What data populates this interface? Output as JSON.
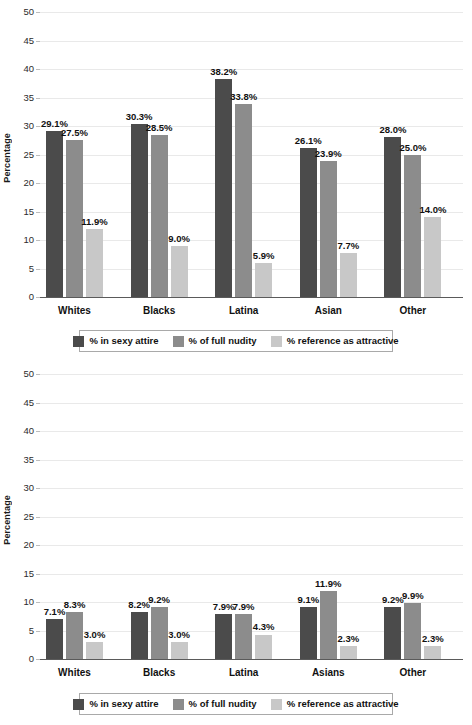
{
  "figure": {
    "background": "#ffffff",
    "series_colors": [
      "#4b4b4b",
      "#8c8c8c",
      "#c8c8c8"
    ]
  },
  "legend": {
    "items": [
      {
        "label": "% in sexy attire",
        "color": "#4b4b4b"
      },
      {
        "label": "% of full nudity",
        "color": "#8c8c8c"
      },
      {
        "label": "% reference as attractive",
        "color": "#c8c8c8"
      }
    ]
  },
  "chart_data": [
    {
      "id": "top",
      "type": "bar",
      "title": "",
      "xlabel": "",
      "ylabel": "Percentage",
      "ylim": [
        0,
        50
      ],
      "yticks": [
        0,
        5,
        10,
        15,
        20,
        25,
        30,
        35,
        40,
        45,
        50
      ],
      "ytick_labels": [
        "0",
        "5",
        "10",
        "15",
        "20",
        "25",
        "30",
        "35",
        "40",
        "45",
        "50"
      ],
      "grid": true,
      "legend_position": "below",
      "categories": [
        "Whites",
        "Blacks",
        "Latina",
        "Asian",
        "Other"
      ],
      "series": [
        {
          "name": "% in sexy attire",
          "color": "#4b4b4b",
          "values": [
            29.1,
            30.3,
            38.2,
            26.1,
            28.0
          ],
          "labels": [
            "29.1%",
            "30.3%",
            "38.2%",
            "26.1%",
            "28.0%"
          ]
        },
        {
          "name": "% of full nudity",
          "color": "#8c8c8c",
          "values": [
            27.5,
            28.5,
            33.8,
            23.9,
            25.0
          ],
          "labels": [
            "27.5%",
            "28.5%",
            "33.8%",
            "23.9%",
            "25.0%"
          ]
        },
        {
          "name": "% reference as attractive",
          "color": "#c8c8c8",
          "values": [
            11.9,
            9.0,
            5.9,
            7.7,
            14.0
          ],
          "labels": [
            "11.9%",
            "9.0%",
            "5.9%",
            "7.7%",
            "14.0%"
          ]
        }
      ]
    },
    {
      "id": "bottom",
      "type": "bar",
      "title": "",
      "xlabel": "",
      "ylabel": "Percentage",
      "ylim": [
        0,
        50
      ],
      "yticks": [
        0,
        5,
        10,
        15,
        20,
        25,
        30,
        35,
        40,
        45,
        50
      ],
      "ytick_labels": [
        "0",
        "5",
        "10",
        "15",
        "20",
        "25",
        "30",
        "35",
        "40",
        "45",
        "50"
      ],
      "grid": true,
      "legend_position": "below",
      "categories": [
        "Whites",
        "Blacks",
        "Latina",
        "Asians",
        "Other"
      ],
      "series": [
        {
          "name": "% in sexy attire",
          "color": "#4b4b4b",
          "values": [
            7.1,
            8.2,
            7.9,
            9.1,
            9.2
          ],
          "labels": [
            "7.1%",
            "8.2%",
            "7.9%",
            "9.1%",
            "9.2%"
          ]
        },
        {
          "name": "% of full nudity",
          "color": "#8c8c8c",
          "values": [
            8.3,
            9.2,
            7.9,
            11.9,
            9.9
          ],
          "labels": [
            "8.3%",
            "9.2%",
            "7.9%",
            "11.9%",
            "9.9%"
          ]
        },
        {
          "name": "% reference as attractive",
          "color": "#c8c8c8",
          "values": [
            3.0,
            3.0,
            4.3,
            2.3,
            2.3
          ],
          "labels": [
            "3.0%",
            "3.0%",
            "4.3%",
            "2.3%",
            "2.3%"
          ]
        }
      ]
    }
  ]
}
